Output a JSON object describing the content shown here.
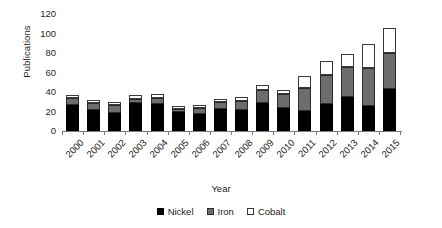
{
  "chart_data": {
    "type": "bar",
    "stacked": true,
    "title": "",
    "xlabel": "Year",
    "ylabel": "Publications",
    "ylim": [
      0,
      120
    ],
    "yticks": [
      120,
      100,
      80,
      60,
      40,
      20,
      0
    ],
    "grid": false,
    "legend_position": "bottom",
    "categories": [
      "2000",
      "2001",
      "2002",
      "2003",
      "2004",
      "2005",
      "2006",
      "2007",
      "2008",
      "2009",
      "2010",
      "2011",
      "2012",
      "2013",
      "2014",
      "2015"
    ],
    "series": [
      {
        "name": "Nickel",
        "color": "#000000",
        "values": [
          27,
          22,
          18,
          29,
          28,
          19,
          17,
          23,
          22,
          29,
          24,
          21,
          28,
          35,
          26,
          43
        ]
      },
      {
        "name": "Iron",
        "color": "#6d6d6d",
        "values": [
          7,
          7,
          9,
          4,
          6,
          4,
          7,
          7,
          9,
          13,
          14,
          23,
          29,
          31,
          39,
          37
        ]
      },
      {
        "name": "Cobalt",
        "color": "#ffffff",
        "values": [
          3,
          3,
          3,
          4,
          4,
          3,
          3,
          3,
          4,
          5,
          4,
          12,
          15,
          13,
          24,
          26
        ]
      }
    ],
    "totals": [
      37,
      32,
      30,
      37,
      38,
      26,
      27,
      33,
      35,
      47,
      42,
      56,
      72,
      79,
      89,
      106
    ]
  },
  "legend": {
    "items": [
      {
        "label": "Nickel",
        "swatch": "nickel-swatch"
      },
      {
        "label": "Iron",
        "swatch": "iron-swatch"
      },
      {
        "label": "Cobalt",
        "swatch": "cobalt-swatch"
      }
    ]
  }
}
